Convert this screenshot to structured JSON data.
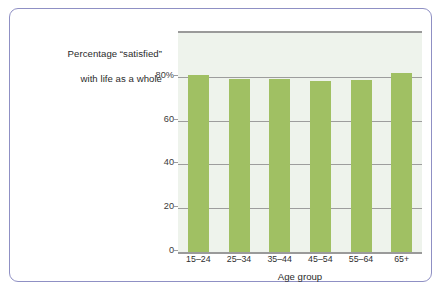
{
  "figure": {
    "frame_color": "#8f90c4",
    "background_color": "#ffffff"
  },
  "title": {
    "line1": "Percentage “satisfied”",
    "line2": "with life as a whole"
  },
  "axes": {
    "x_title": "Age group",
    "y_tick_labels": [
      "80%",
      "60",
      "40",
      "20",
      "0"
    ],
    "y_tick_values": [
      80,
      60,
      40,
      20,
      0
    ]
  },
  "chart_data": {
    "type": "bar",
    "title": "Percentage “satisfied” with life as a whole",
    "xlabel": "Age group",
    "ylabel": "Percentage “satisfied” with life as a whole",
    "categories": [
      "15–24",
      "25–34",
      "35–44",
      "45–54",
      "55–64",
      "65+"
    ],
    "values": [
      80.8,
      79.2,
      79.0,
      78.2,
      78.6,
      81.8
    ],
    "ylim": [
      0,
      100
    ],
    "yticks": [
      0,
      20,
      40,
      60,
      80
    ],
    "ytick_labels": [
      "0",
      "20",
      "40",
      "60",
      "80%"
    ],
    "grid": true,
    "legend": false,
    "bar_color": "#a0c063",
    "plot_background": "#eef3ec",
    "gridline_color": "#9d9d9d"
  }
}
